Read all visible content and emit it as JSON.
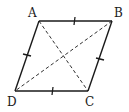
{
  "figure": {
    "stroke_color": "#1a1a1a",
    "vertices": {
      "A": {
        "label": "A",
        "x": 39,
        "y": 21,
        "label_x": 28,
        "label_y": 17
      },
      "B": {
        "label": "B",
        "x": 112,
        "y": 21,
        "label_x": 114,
        "label_y": 17
      },
      "C": {
        "label": "C",
        "x": 88,
        "y": 91,
        "label_x": 85,
        "label_y": 105
      },
      "D": {
        "label": "D",
        "x": 15,
        "y": 91,
        "label_x": 7,
        "label_y": 105
      }
    },
    "sides": [
      "AB",
      "BC",
      "CD",
      "DA"
    ],
    "diagonals": [
      "AC",
      "BD"
    ],
    "diagonal_style": "dashed",
    "equal_side_ticks": 1
  }
}
